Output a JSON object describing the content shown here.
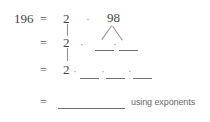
{
  "problem": {
    "start_number": "196",
    "equals": "=",
    "dot": "·",
    "note": "using exponents"
  },
  "rows": [
    {
      "id": "row-1",
      "equals": "=",
      "left_factor": "2",
      "dot": "·",
      "right_factor": "98",
      "blanks": 0
    },
    {
      "id": "row-2",
      "equals": "=",
      "left_factor": "2",
      "dot": "·",
      "blanks": 2
    },
    {
      "id": "row-3",
      "equals": "=",
      "left_factor": "2",
      "dot": "·",
      "blanks": 3
    },
    {
      "id": "row-4",
      "equals": "=",
      "blanks": 1,
      "note": "using exponents"
    }
  ],
  "colors": {
    "background": "#ffffff",
    "ink": "#454545",
    "rule": "#6f6f6f",
    "tree_line": "#8f8f8f",
    "note_text": "#6a6a6a"
  }
}
